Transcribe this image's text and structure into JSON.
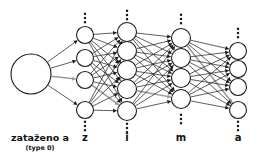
{
  "diagram": {
    "canvas": {
      "width": 257,
      "height": 165,
      "background": "#ffffff"
    },
    "colors": {
      "stroke": "#1a1a1a",
      "node_fill": "#ffffff",
      "highlight": "#9a9a9a",
      "text": "#111111"
    },
    "input": {
      "label": "zataženo a",
      "sublabel": "(type 0)",
      "cx": 31,
      "cy": 74,
      "r": 20
    },
    "layers": [
      {
        "id": "z",
        "label": "z",
        "cx": 85,
        "r": 8.5,
        "nodes_y": [
          35,
          58,
          80,
          110
        ],
        "ellipsis_above": 18,
        "ellipsis_below": 126,
        "label_y": 141
      },
      {
        "id": "i",
        "label": "i",
        "cx": 127,
        "r": 9.5,
        "nodes_y": [
          32,
          51,
          70,
          89,
          111
        ],
        "ellipsis_above": 15,
        "ellipsis_below": 128,
        "label_y": 141
      },
      {
        "id": "m",
        "label": "m",
        "cx": 181,
        "r": 9.5,
        "nodes_y": [
          38,
          58,
          78,
          99
        ],
        "ellipsis_above": 19,
        "ellipsis_below": 119,
        "label_y": 141
      },
      {
        "id": "a",
        "label": "a",
        "cx": 238,
        "r": 8.5,
        "nodes_y": [
          51,
          69,
          87,
          110
        ],
        "ellipsis_above": 33,
        "ellipsis_below": 126,
        "label_y": 141
      }
    ],
    "highlighted_path": {
      "description": "gray highlighted signal path",
      "segments": [
        {
          "from_layer": "input",
          "from_index": 0,
          "to_layer": "z",
          "to_index": 2
        },
        {
          "from_layer": "z",
          "from_index": 2,
          "to_layer": "i",
          "to_index": 4
        },
        {
          "from_layer": "i",
          "from_index": 3,
          "to_layer": "m",
          "to_index": 3
        },
        {
          "from_layer": "m",
          "from_index": 0,
          "to_layer": "a",
          "to_index": 3
        }
      ]
    },
    "ellipsis_dots": 3
  }
}
